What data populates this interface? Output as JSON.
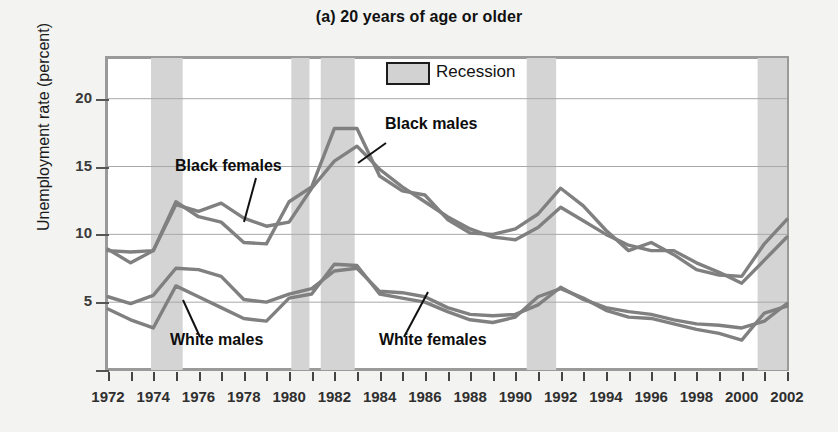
{
  "title": "(a) 20 years of age or older",
  "ylabel": "Unemployment rate (percent)",
  "legend": {
    "recession_label": "Recession",
    "swatch_color": "#d2d2d2"
  },
  "annotations": {
    "black_females": "Black females",
    "black_males": "Black males",
    "white_males": "White males",
    "white_females": "White females"
  },
  "chart_data": {
    "type": "line",
    "title": "(a) 20 years of age or older",
    "xlabel": "",
    "ylabel": "Unemployment rate (percent)",
    "xlim": [
      1972,
      2002
    ],
    "ylim": [
      0,
      23
    ],
    "yticks": [
      5,
      10,
      15,
      20
    ],
    "ytick_labels": [
      "5",
      "10",
      "15",
      "20"
    ],
    "xticks": [
      1972,
      1973,
      1974,
      1975,
      1976,
      1977,
      1978,
      1979,
      1980,
      1981,
      1982,
      1983,
      1984,
      1985,
      1986,
      1987,
      1988,
      1989,
      1990,
      1991,
      1992,
      1993,
      1994,
      1995,
      1996,
      1997,
      1998,
      1999,
      2000,
      2001,
      2002
    ],
    "xtick_labels": [
      "1972",
      "1974",
      "1976",
      "1978",
      "1980",
      "1982",
      "1984",
      "1986",
      "1988",
      "1990",
      "1992",
      "1994",
      "1996",
      "1998",
      "2000",
      "2002"
    ],
    "xtick_labeled_years": [
      1972,
      1974,
      1976,
      1978,
      1980,
      1982,
      1984,
      1986,
      1988,
      1990,
      1992,
      1994,
      1996,
      1998,
      2000,
      2002
    ],
    "grid": "horizontal",
    "legend_position": "top-center",
    "line_color": "#808080",
    "x": [
      1972,
      1973,
      1974,
      1975,
      1976,
      1977,
      1978,
      1979,
      1980,
      1981,
      1982,
      1983,
      1984,
      1985,
      1986,
      1987,
      1988,
      1989,
      1990,
      1991,
      1992,
      1993,
      1994,
      1995,
      1996,
      1997,
      1998,
      1999,
      2000,
      2001,
      2002
    ],
    "series": [
      {
        "name": "Black males",
        "values": [
          8.9,
          7.9,
          8.8,
          12.4,
          11.3,
          10.9,
          9.4,
          9.3,
          12.4,
          13.5,
          17.8,
          17.8,
          14.3,
          13.2,
          12.9,
          11.1,
          10.1,
          10.0,
          10.4,
          11.5,
          13.4,
          12.1,
          10.3,
          8.8,
          9.4,
          8.5,
          7.4,
          7.0,
          6.9,
          9.3,
          11.1
        ]
      },
      {
        "name": "Black females",
        "values": [
          8.8,
          8.7,
          8.8,
          12.2,
          11.7,
          12.3,
          11.2,
          10.6,
          10.9,
          13.4,
          15.4,
          16.5,
          14.8,
          13.5,
          12.4,
          11.3,
          10.4,
          9.8,
          9.6,
          10.5,
          12.0,
          11.0,
          10.0,
          9.2,
          8.8,
          8.8,
          7.9,
          7.2,
          6.4,
          8.1,
          9.8
        ]
      },
      {
        "name": "White females",
        "values": [
          5.4,
          4.9,
          5.5,
          7.5,
          7.4,
          6.9,
          5.2,
          5.0,
          5.6,
          6.0,
          7.3,
          7.5,
          5.8,
          5.7,
          5.4,
          4.6,
          4.1,
          4.0,
          4.1,
          4.8,
          6.1,
          5.2,
          4.6,
          4.3,
          4.1,
          3.7,
          3.4,
          3.3,
          3.1,
          3.6,
          4.9
        ]
      },
      {
        "name": "White males",
        "values": [
          4.5,
          3.7,
          3.1,
          6.2,
          5.4,
          4.6,
          3.8,
          3.6,
          5.3,
          5.6,
          7.8,
          7.7,
          5.6,
          5.3,
          5.0,
          4.3,
          3.7,
          3.5,
          3.9,
          5.4,
          6.0,
          5.3,
          4.4,
          3.9,
          3.8,
          3.4,
          3.0,
          2.7,
          2.2,
          4.2,
          4.7
        ]
      }
    ],
    "recessions": [
      {
        "start": 1973.9,
        "end": 1975.3
      },
      {
        "start": 1980.1,
        "end": 1980.9
      },
      {
        "start": 1981.4,
        "end": 1982.9
      },
      {
        "start": 1990.5,
        "end": 1991.8
      },
      {
        "start": 2000.7,
        "end": 2002.0
      }
    ]
  }
}
